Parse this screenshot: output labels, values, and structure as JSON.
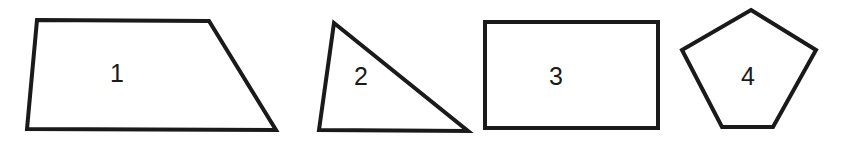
{
  "figure": {
    "background_color": "#ffffff",
    "stroke_color": "#1a1a1a",
    "label_color": "#1a1a1a",
    "stroke_width": 4,
    "width": 843,
    "height": 141
  },
  "shapes": [
    {
      "label": "1",
      "name": "trapezoid",
      "points": "37,20 209,21 276,130 27,129",
      "label_x": 117,
      "label_y": 75
    },
    {
      "label": "2",
      "name": "triangle",
      "points": "334,23 468,131 319,130",
      "label_x": 361,
      "label_y": 78
    },
    {
      "label": "3",
      "name": "rectangle",
      "points": "485,22 658,22 658,128 485,128",
      "label_x": 556,
      "label_y": 78
    },
    {
      "label": "4",
      "name": "pentagon",
      "points": "751,10 816,50 773,127 722,127 682,50",
      "label_x": 748,
      "label_y": 78
    }
  ]
}
